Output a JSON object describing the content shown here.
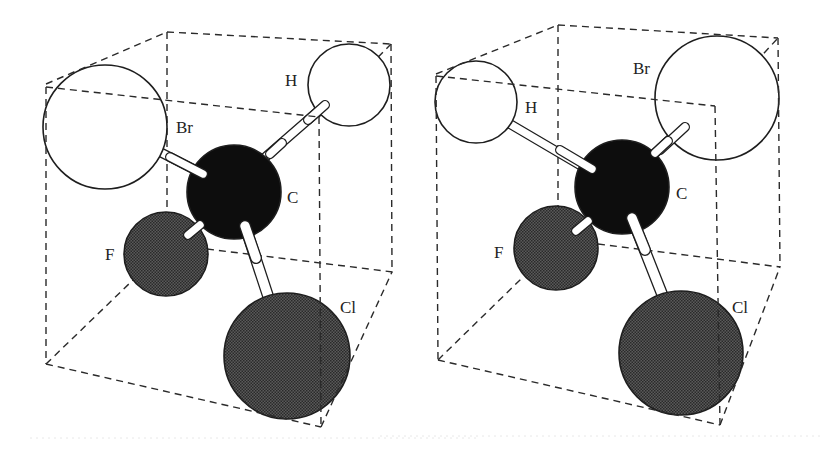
{
  "figure": {
    "colors": {
      "carbon": "#0d0d0d",
      "hatched": "#4a4a4a",
      "open_atom": "#ffffff",
      "edge": "#2a2a2a"
    }
  },
  "molecules": [
    {
      "id": "left",
      "labels": {
        "H": "H",
        "Br": "Br",
        "C": "C",
        "F": "F",
        "Cl": "Cl"
      },
      "atoms": [
        {
          "element": "Br",
          "cx": 105,
          "cy": 127,
          "r": 62,
          "fill": "white"
        },
        {
          "element": "H",
          "cx": 349,
          "cy": 85,
          "r": 41,
          "fill": "white"
        },
        {
          "element": "C",
          "cx": 234,
          "cy": 192,
          "r": 47,
          "fill": "black"
        },
        {
          "element": "F",
          "cx": 166,
          "cy": 254,
          "r": 42,
          "fill": "hatched"
        },
        {
          "element": "Cl",
          "cx": 287,
          "cy": 356,
          "r": 63,
          "fill": "hatched"
        }
      ]
    },
    {
      "id": "right",
      "labels": {
        "H": "H",
        "Br": "Br",
        "C": "C",
        "F": "F",
        "Cl": "Cl"
      },
      "atoms": [
        {
          "element": "H",
          "cx": 476,
          "cy": 102,
          "r": 41,
          "fill": "white"
        },
        {
          "element": "Br",
          "cx": 717,
          "cy": 98,
          "r": 62,
          "fill": "white"
        },
        {
          "element": "C",
          "cx": 622,
          "cy": 187,
          "r": 47,
          "fill": "black"
        },
        {
          "element": "F",
          "cx": 556,
          "cy": 248,
          "r": 42,
          "fill": "hatched"
        },
        {
          "element": "Cl",
          "cx": 681,
          "cy": 353,
          "r": 62,
          "fill": "hatched"
        }
      ]
    }
  ]
}
